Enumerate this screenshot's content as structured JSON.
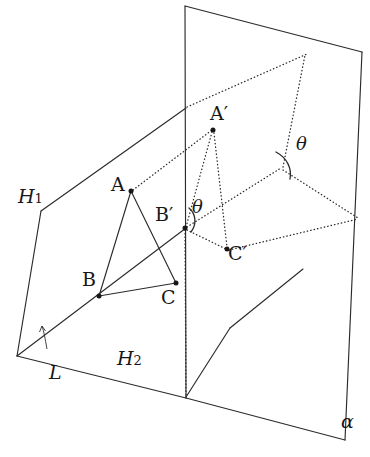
{
  "figure": {
    "type": "3d-geometry-diagram",
    "canvas": {
      "width": 370,
      "height": 457
    },
    "background_color": "#ffffff",
    "ink_color": "#2b2b2b"
  },
  "labels": {
    "h1": {
      "text": "H",
      "sub": "1",
      "x": 18,
      "y": 187
    },
    "h2": {
      "text": "H",
      "sub": "2",
      "x": 117,
      "y": 349
    },
    "l": {
      "text": "L",
      "x": 49,
      "y": 363
    },
    "alpha": {
      "text": "α",
      "x": 341,
      "y": 412
    },
    "point_a": {
      "text": "A",
      "x": 111,
      "y": 175
    },
    "point_b": {
      "text": "B",
      "x": 82,
      "y": 270
    },
    "point_c": {
      "text": "C",
      "x": 161,
      "y": 288
    },
    "point_a_prime": {
      "text": "A",
      "prime": "′",
      "x": 210,
      "y": 104
    },
    "point_b_prime": {
      "text": "B",
      "prime": "′",
      "x": 155,
      "y": 205
    },
    "point_c_prime": {
      "text": "C",
      "prime": "′",
      "x": 228,
      "y": 244
    },
    "theta_near": {
      "text": "θ",
      "x": 192,
      "y": 198
    },
    "theta_far": {
      "text": "θ",
      "x": 296,
      "y": 135
    }
  },
  "points": {
    "A": {
      "x": 131,
      "y": 191
    },
    "B": {
      "x": 99,
      "y": 296
    },
    "C": {
      "x": 176,
      "y": 283
    },
    "A_prime": {
      "x": 213,
      "y": 130
    },
    "B_prime": {
      "x": 185,
      "y": 228
    },
    "C_prime": {
      "x": 227,
      "y": 249
    },
    "L_vertex": {
      "x": 17,
      "y": 356
    },
    "H1_left_corner": {
      "x": 41,
      "y": 211
    },
    "H1_top_right": {
      "x": 186,
      "y": 108
    },
    "plane_top_left": {
      "x": 185,
      "y": 6
    },
    "plane_top_right": {
      "x": 362,
      "y": 52
    },
    "plane_bottom_left": {
      "x": 186,
      "y": 398
    },
    "plane_bottom_right": {
      "x": 345,
      "y": 440
    },
    "plane_right_upper": {
      "x": 363,
      "y": 53
    },
    "fold_vertex": {
      "x": 282,
      "y": 169
    },
    "right_mid": {
      "x": 358,
      "y": 218
    },
    "h2_bend": {
      "x": 230,
      "y": 328
    },
    "h2_right_end": {
      "x": 303,
      "y": 269
    }
  },
  "segments": {
    "solid": [
      {
        "name": "h1-upper-left-edge",
        "from": "H1_left_corner",
        "to": "H1_top_right"
      },
      {
        "name": "h1-left-edge",
        "from": "L_vertex",
        "to": "H1_left_corner"
      },
      {
        "name": "h1-lower-right-edge",
        "from": "L_vertex",
        "to": "B_prime"
      },
      {
        "name": "h2-front-edge",
        "from": "L_vertex",
        "to": "plane_bottom_left"
      },
      {
        "name": "h2-right-edge",
        "from": "h2_bend",
        "to": "h2_right_end"
      },
      {
        "name": "plane-top-edge",
        "from": "plane_top_left",
        "to": "plane_top_right"
      },
      {
        "name": "plane-left-edge",
        "from": "plane_top_left",
        "to": "plane_bottom_left"
      },
      {
        "name": "plane-bottom-edge",
        "from": "plane_bottom_left",
        "to": "plane_bottom_right"
      },
      {
        "name": "plane-right-edge",
        "from": "plane_top_right",
        "to": "plane_bottom_right"
      }
    ],
    "triangle": [
      {
        "name": "edge-AB",
        "from": "A",
        "to": "B"
      },
      {
        "name": "edge-BC",
        "from": "B",
        "to": "C"
      },
      {
        "name": "edge-CA",
        "from": "C",
        "to": "A"
      }
    ],
    "dotted": [
      {
        "name": "proj-A-to-Aprime",
        "from": "A",
        "to": "A_prime"
      },
      {
        "name": "proj-Aprime-to-Bprime",
        "from": "A_prime",
        "to": "B_prime"
      },
      {
        "name": "proj-Aprime-to-Cprime",
        "from": "A_prime",
        "to": "C_prime"
      },
      {
        "name": "proj-Bprime-to-Cprime",
        "from": "B_prime",
        "to": "C_prime"
      },
      {
        "name": "hidden-plane-diag-left",
        "from": "B_prime",
        "to": "fold_vertex"
      },
      {
        "name": "hidden-plane-diag-right",
        "from": "fold_vertex",
        "to": "right_mid"
      },
      {
        "name": "hidden-plane-lower",
        "from": "B_prime",
        "to": "right_mid"
      },
      {
        "name": "hidden-plane-rise",
        "from": "fold_vertex",
        "to": "plane_right_upper"
      },
      {
        "name": "hidden-plane-top",
        "from": "H1_top_right",
        "to": "plane_right_upper"
      },
      {
        "name": "vertical-drop",
        "from": "B_prime",
        "to": "plane_bottom_left"
      }
    ]
  },
  "angles": [
    {
      "name": "theta-near-bprime",
      "label": "θ",
      "vertex": "B_prime"
    },
    {
      "name": "theta-far-fold",
      "label": "θ",
      "vertex": "fold_vertex"
    },
    {
      "name": "dihedral-L-arrow",
      "label": "L",
      "vertex": "L_vertex"
    }
  ]
}
